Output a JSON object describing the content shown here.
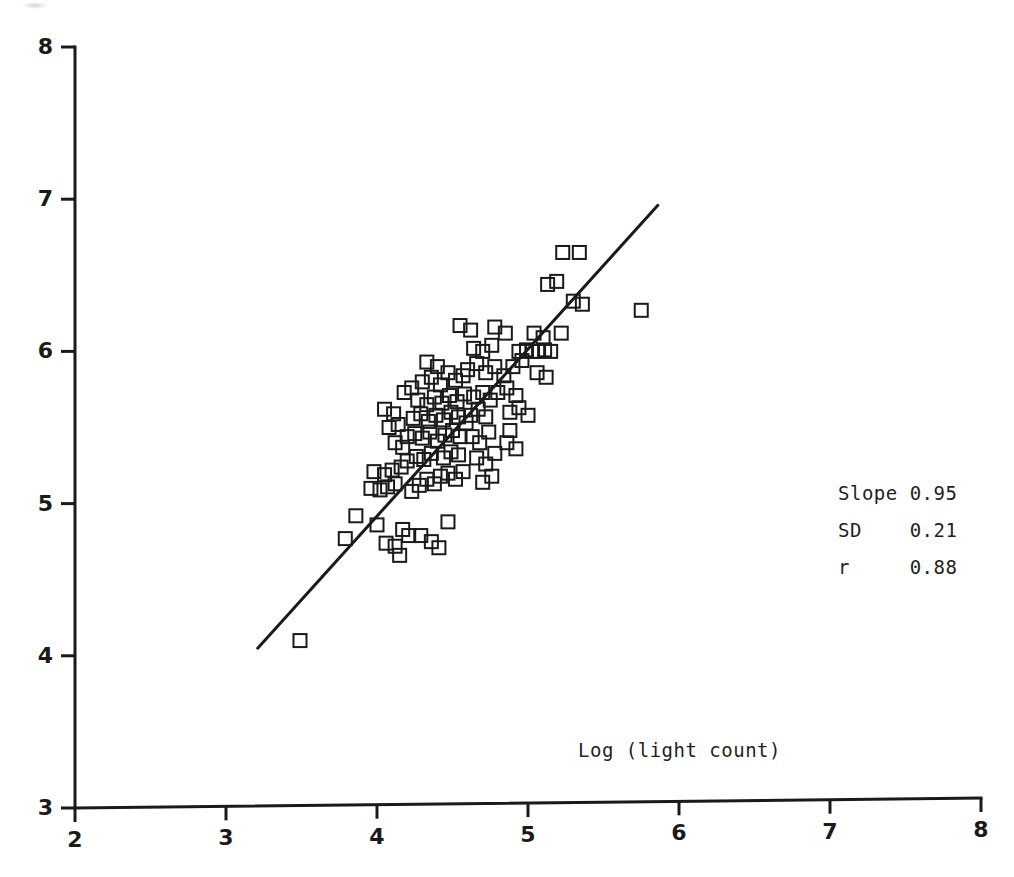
{
  "figure": {
    "background_color": "#ffffff",
    "ink_color": "#1a1a1a",
    "width": 1014,
    "height": 877
  },
  "annotations": {
    "x_axis_title": "Log (light count)",
    "stats": [
      {
        "name": "slope",
        "label": "Slope 0.95"
      },
      {
        "name": "sd",
        "label": "SD    0.21"
      },
      {
        "name": "r",
        "label": "r     0.88"
      }
    ]
  },
  "chart_data": {
    "type": "scatter",
    "title": "",
    "xlabel": "Log (light count)",
    "ylabel": "",
    "xlim": [
      2,
      8
    ],
    "ylim": [
      3,
      8
    ],
    "xticks": [
      2,
      3,
      4,
      5,
      6,
      7,
      8
    ],
    "yticks": [
      3,
      4,
      5,
      6,
      7,
      8
    ],
    "xticklabels": [
      "2",
      "3",
      "4",
      "5",
      "6",
      "7",
      "8"
    ],
    "yticklabels": [
      "3",
      "4",
      "5",
      "6",
      "7",
      "8"
    ],
    "grid": false,
    "legend": null,
    "marker": {
      "style": "open-square",
      "size_px": 13,
      "stroke_px": 2,
      "fill": "none",
      "color": "#1a1a1a"
    },
    "fit_line": {
      "name": "regression-line",
      "slope": 0.95,
      "sd": 0.21,
      "r": 0.88,
      "x_start": 3.21,
      "y_start": 4.05,
      "x_end": 5.86,
      "y_end": 6.96,
      "color": "#1a1a1a",
      "width_px": 3
    },
    "stat_labels": {
      "slope": "Slope 0.95",
      "sd": "SD    0.21",
      "r": "r     0.88"
    },
    "points": [
      [
        3.49,
        4.1
      ],
      [
        3.79,
        4.77
      ],
      [
        3.86,
        4.92
      ],
      [
        3.96,
        5.1
      ],
      [
        4.02,
        5.09
      ],
      [
        4.07,
        5.11
      ],
      [
        4.12,
        5.13
      ],
      [
        3.98,
        5.21
      ],
      [
        4.05,
        5.19
      ],
      [
        4.1,
        5.22
      ],
      [
        4.16,
        5.24
      ],
      [
        4.0,
        4.86
      ],
      [
        4.06,
        4.74
      ],
      [
        4.12,
        4.72
      ],
      [
        4.17,
        4.83
      ],
      [
        4.15,
        4.66
      ],
      [
        4.21,
        4.79
      ],
      [
        4.23,
        5.08
      ],
      [
        4.28,
        5.12
      ],
      [
        4.33,
        5.16
      ],
      [
        4.38,
        5.13
      ],
      [
        4.2,
        5.28
      ],
      [
        4.26,
        5.31
      ],
      [
        4.31,
        5.29
      ],
      [
        4.36,
        5.33
      ],
      [
        4.42,
        5.18
      ],
      [
        4.47,
        5.2
      ],
      [
        4.52,
        5.16
      ],
      [
        4.57,
        5.21
      ],
      [
        4.44,
        5.3
      ],
      [
        4.49,
        5.34
      ],
      [
        4.54,
        5.32
      ],
      [
        4.2,
        5.44
      ],
      [
        4.25,
        5.46
      ],
      [
        4.3,
        5.43
      ],
      [
        4.35,
        5.47
      ],
      [
        4.4,
        5.41
      ],
      [
        4.45,
        5.45
      ],
      [
        4.5,
        5.48
      ],
      [
        4.55,
        5.44
      ],
      [
        4.24,
        5.56
      ],
      [
        4.29,
        5.59
      ],
      [
        4.34,
        5.54
      ],
      [
        4.39,
        5.58
      ],
      [
        4.44,
        5.55
      ],
      [
        4.49,
        5.6
      ],
      [
        4.54,
        5.57
      ],
      [
        4.59,
        5.53
      ],
      [
        4.27,
        5.68
      ],
      [
        4.33,
        5.65
      ],
      [
        4.38,
        5.7
      ],
      [
        4.43,
        5.66
      ],
      [
        4.48,
        5.71
      ],
      [
        4.53,
        5.67
      ],
      [
        4.58,
        5.72
      ],
      [
        4.12,
        5.4
      ],
      [
        4.17,
        5.37
      ],
      [
        4.08,
        5.5
      ],
      [
        4.14,
        5.52
      ],
      [
        4.05,
        5.62
      ],
      [
        4.11,
        5.59
      ],
      [
        4.18,
        5.73
      ],
      [
        4.23,
        5.76
      ],
      [
        4.3,
        5.8
      ],
      [
        4.36,
        5.83
      ],
      [
        4.42,
        5.78
      ],
      [
        4.47,
        5.86
      ],
      [
        4.52,
        5.81
      ],
      [
        4.57,
        5.84
      ],
      [
        4.33,
        5.93
      ],
      [
        4.4,
        5.9
      ],
      [
        4.62,
        5.58
      ],
      [
        4.67,
        5.62
      ],
      [
        4.72,
        5.57
      ],
      [
        4.64,
        5.7
      ],
      [
        4.7,
        5.73
      ],
      [
        4.75,
        5.68
      ],
      [
        4.63,
        5.44
      ],
      [
        4.68,
        5.4
      ],
      [
        4.74,
        5.47
      ],
      [
        4.66,
        5.3
      ],
      [
        4.72,
        5.26
      ],
      [
        4.78,
        5.33
      ],
      [
        4.7,
        5.14
      ],
      [
        4.76,
        5.18
      ],
      [
        4.86,
        5.4
      ],
      [
        4.92,
        5.36
      ],
      [
        4.6,
        5.88
      ],
      [
        4.66,
        5.92
      ],
      [
        4.72,
        5.86
      ],
      [
        4.78,
        5.9
      ],
      [
        4.84,
        5.84
      ],
      [
        4.64,
        6.02
      ],
      [
        4.7,
        6.0
      ],
      [
        4.76,
        6.04
      ],
      [
        4.55,
        6.17
      ],
      [
        4.62,
        6.14
      ],
      [
        4.78,
        6.16
      ],
      [
        4.85,
        6.12
      ],
      [
        4.8,
        5.73
      ],
      [
        4.86,
        5.76
      ],
      [
        4.92,
        5.71
      ],
      [
        4.88,
        5.6
      ],
      [
        4.94,
        5.63
      ],
      [
        5.0,
        5.58
      ],
      [
        4.9,
        5.9
      ],
      [
        4.96,
        5.94
      ],
      [
        4.94,
        6.0
      ],
      [
        4.99,
        6.01
      ],
      [
        5.03,
        6.0
      ],
      [
        5.07,
        6.0
      ],
      [
        5.11,
        6.01
      ],
      [
        5.15,
        6.0
      ],
      [
        5.06,
        5.86
      ],
      [
        5.12,
        5.83
      ],
      [
        5.04,
        6.12
      ],
      [
        5.1,
        6.09
      ],
      [
        5.13,
        6.44
      ],
      [
        5.19,
        6.46
      ],
      [
        5.23,
        6.65
      ],
      [
        5.34,
        6.65
      ],
      [
        5.3,
        6.33
      ],
      [
        5.36,
        6.31
      ],
      [
        5.22,
        6.12
      ],
      [
        4.47,
        4.88
      ],
      [
        4.36,
        4.75
      ],
      [
        4.41,
        4.71
      ],
      [
        4.29,
        4.79
      ],
      [
        4.88,
        5.48
      ],
      [
        5.75,
        6.27
      ]
    ]
  }
}
